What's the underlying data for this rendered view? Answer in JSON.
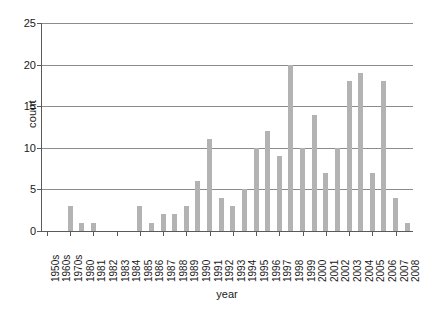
{
  "chart_data": {
    "type": "bar",
    "title": "",
    "xlabel": "year",
    "ylabel": "count",
    "ylim": [
      0,
      25
    ],
    "yticks": [
      0,
      5,
      10,
      15,
      20,
      25
    ],
    "grid": true,
    "legend": "none",
    "bar_color": "#b3b3b3",
    "axis_color": "#5a5a5a",
    "grid_color": "#8c8c8c",
    "categories": [
      "1950s",
      "1960s",
      "1970s",
      "1980",
      "1981",
      "1982",
      "1983",
      "1984",
      "1985",
      "1986",
      "1987",
      "1988",
      "1989",
      "1990",
      "1991",
      "1992",
      "1993",
      "1994",
      "1995",
      "1996",
      "1997",
      "1998",
      "1999",
      "2000",
      "2001",
      "2002",
      "2003",
      "2004",
      "2005",
      "2006",
      "2007",
      "2008"
    ],
    "values": [
      0,
      0,
      3,
      1,
      1,
      0,
      0,
      0,
      3,
      1,
      2,
      2,
      3,
      6,
      11,
      4,
      3,
      5,
      10,
      12,
      9,
      20,
      10,
      14,
      7,
      10,
      18,
      19,
      7,
      18,
      4,
      1
    ]
  },
  "header": {
    "cut_text": ""
  }
}
